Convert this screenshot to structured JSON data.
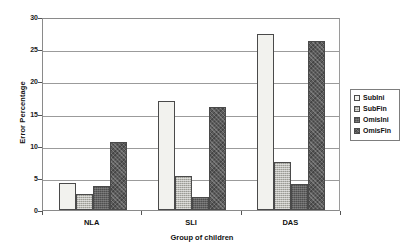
{
  "chart_data": {
    "type": "bar",
    "title": "",
    "xlabel": "Group of children",
    "ylabel": "Error Percentage",
    "categories": [
      "NLA",
      "SLI",
      "DAS"
    ],
    "series": [
      {
        "name": "SubIni",
        "values": [
          4.2,
          17.0,
          27.3
        ],
        "color": "#f2f2ee"
      },
      {
        "name": "SubFin",
        "values": [
          2.5,
          5.3,
          7.5
        ],
        "color": "#b9b9b2"
      },
      {
        "name": "OmisIni",
        "values": [
          3.8,
          2.0,
          4.0
        ],
        "color": "#636363"
      },
      {
        "name": "OmisFin",
        "values": [
          10.5,
          16.0,
          26.3
        ],
        "color": "#5b5b5b"
      }
    ],
    "ylim": [
      0,
      30
    ],
    "yticks": [
      0,
      5,
      10,
      15,
      20,
      25,
      30
    ],
    "ytick_labels": [
      "0",
      "5",
      "10",
      "15",
      "20",
      "25",
      "30"
    ],
    "grid": true,
    "legend_position": "right"
  },
  "legend": {
    "items": [
      {
        "label": "SubIni"
      },
      {
        "label": "SubFin"
      },
      {
        "label": "OmisIni"
      },
      {
        "label": "OmisFin"
      }
    ]
  }
}
